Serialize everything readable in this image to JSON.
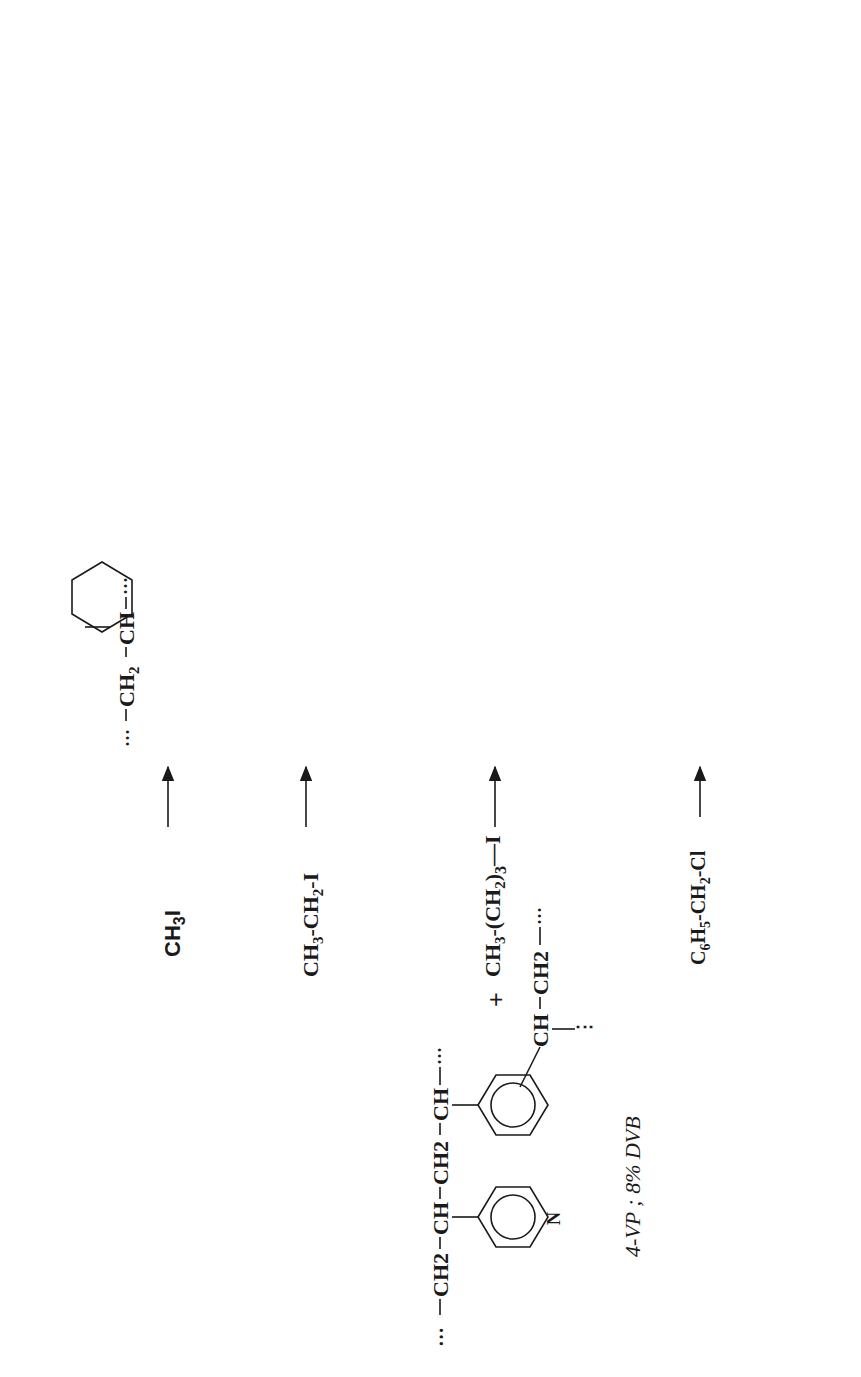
{
  "figure": {
    "orientation": "rotated-90-ccw",
    "starting_material": {
      "label": "4-VP ; 8% DVB",
      "chain_left": "CH2",
      "chain_ch1": "CH",
      "chain_ch2": "CH2",
      "chain_ch3": "CH",
      "pyridine_n": "N",
      "dvb_ch": "CH",
      "dvb_ch2": "CH2",
      "plus": "+"
    },
    "reagents": [
      {
        "id": "r1",
        "formula": "CH3I"
      },
      {
        "id": "r2",
        "formula": "CH3-CH2-I"
      },
      {
        "id": "r3",
        "formula": "CH3-(CH2)3-I"
      },
      {
        "id": "r4",
        "formula": "C6H5-CH2-Cl"
      }
    ],
    "quaternized": [
      {
        "id": "q1",
        "anion": "I",
        "substituent": "-CH3",
        "label": ""
      },
      {
        "id": "q2",
        "anion": "I",
        "substituent": "-CH2-CH3",
        "label": ""
      },
      {
        "id": "q3",
        "anion": "I",
        "substituent": "-(CH2)3-CH3",
        "label": ""
      },
      {
        "id": "q4",
        "anion": "Cl",
        "substituent": "-CH2-C6H5",
        "label": "(A4)"
      }
    ],
    "exchange_reagent": "NaCl",
    "exchanged": [
      {
        "id": "A1",
        "anion": "Cl",
        "substituent": "-CH3",
        "label": "(A1)"
      },
      {
        "id": "A2",
        "anion": "Cl",
        "substituent": "-CH2-CH3",
        "label": "(A2)"
      },
      {
        "id": "A3",
        "anion": "Cl",
        "substituent": "-(CH2)3-CH3",
        "label": "(A3)"
      }
    ],
    "backbone": {
      "ch2": "CH2",
      "ch": "CH",
      "nplus": "N",
      "plus": "+",
      "minus": "−"
    }
  }
}
